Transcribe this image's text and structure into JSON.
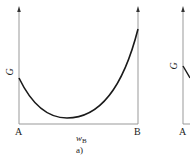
{
  "panels": [
    {
      "id": "a",
      "y_axis_label": "G",
      "x_axis_label_main": "w",
      "x_axis_label_sub": "B",
      "left_endpoint": "A",
      "right_endpoint": "B",
      "caption": "a)"
    },
    {
      "id": "b",
      "y_axis_label": "G",
      "left_endpoint": "A"
    }
  ],
  "colors": {
    "axis": "#999999",
    "curve": "#1a1a1a",
    "text": "#222222"
  }
}
